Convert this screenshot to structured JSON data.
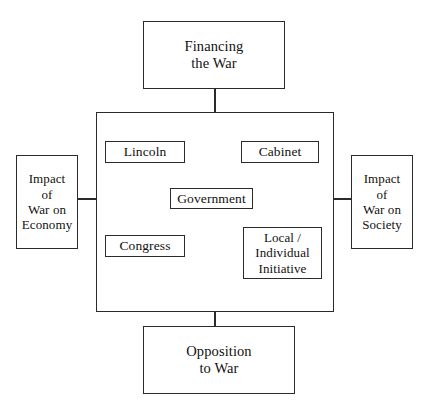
{
  "diagram": {
    "line_color": "#2b2b2b",
    "box_fill": "#ffffff",
    "text_color": "#111111",
    "container": {
      "name": "government-context-container",
      "label": ""
    },
    "nodes": {
      "financing": {
        "label": "Financing\nthe War"
      },
      "opposition": {
        "label": "Opposition\nto War"
      },
      "impact_economy": {
        "label": "Impact\nof\nWar on\nEconomy"
      },
      "impact_society": {
        "label": "Impact\nof\nWar on\nSociety"
      },
      "lincoln": {
        "label": "Lincoln"
      },
      "cabinet": {
        "label": "Cabinet"
      },
      "government": {
        "label": "Government"
      },
      "congress": {
        "label": "Congress"
      },
      "local_individual": {
        "label": "Local /\nIndividual\nInitiative"
      }
    },
    "connectors": [
      {
        "name": "financing-to-container",
        "from": "financing",
        "to": "container",
        "type": "vertical"
      },
      {
        "name": "container-to-opposition",
        "from": "container",
        "to": "opposition",
        "type": "vertical"
      },
      {
        "name": "impact-economy-to-container",
        "from": "impact_economy",
        "to": "container",
        "type": "horizontal"
      },
      {
        "name": "container-to-impact-society",
        "from": "container",
        "to": "impact_society",
        "type": "horizontal"
      },
      {
        "name": "lincoln-to-government",
        "from": "lincoln",
        "to": "government",
        "type": "diagonal"
      },
      {
        "name": "cabinet-to-government",
        "from": "cabinet",
        "to": "government",
        "type": "diagonal"
      },
      {
        "name": "congress-to-government",
        "from": "congress",
        "to": "government",
        "type": "diagonal"
      },
      {
        "name": "local-individual-to-government",
        "from": "local_individual",
        "to": "government",
        "type": "diagonal"
      }
    ]
  }
}
